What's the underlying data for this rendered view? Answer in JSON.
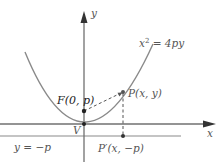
{
  "figure": {
    "curve_label": {
      "base": "x",
      "exp": "2",
      "rest": " = 4py"
    },
    "axes": {
      "x_label": "x",
      "y_label": "y"
    },
    "points": {
      "focus": "F(0, p)",
      "point_on_curve": "P(x, y)",
      "vertex": "V",
      "projection": "P′(x, −p)"
    },
    "directrix_label": "y = −p"
  },
  "colors": {
    "curve": "#8a8a8a",
    "axis": "#707070",
    "directrix": "#8a8a8a",
    "point": "#222222",
    "dashed": "#555555",
    "label": "#555555"
  }
}
